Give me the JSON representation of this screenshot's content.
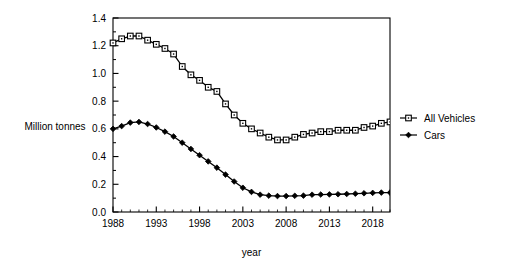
{
  "chart_data": {
    "type": "line",
    "title": "",
    "xlabel": "year",
    "ylabel": "Million tonnes",
    "xlim": [
      1988,
      2020
    ],
    "ylim": [
      0.0,
      1.4
    ],
    "grid": false,
    "legend_position": "right",
    "x_ticks": [
      "1988",
      "1993",
      "1998",
      "2003",
      "2008",
      "2013",
      "2018"
    ],
    "x_tick_values": [
      1988,
      1993,
      1998,
      2003,
      2008,
      2013,
      2018
    ],
    "x_minor_tick_interval": 1,
    "y_ticks": [
      "0.0",
      "0.2",
      "0.4",
      "0.6",
      "0.8",
      "1.0",
      "1.2",
      "1.4"
    ],
    "y_tick_values": [
      0.0,
      0.2,
      0.4,
      0.6,
      0.8,
      1.0,
      1.2,
      1.4
    ],
    "y_minor_tick_interval": 0.1,
    "x": [
      1988,
      1989,
      1990,
      1991,
      1992,
      1993,
      1994,
      1995,
      1996,
      1997,
      1998,
      1999,
      2000,
      2001,
      2002,
      2003,
      2004,
      2005,
      2006,
      2007,
      2008,
      2009,
      2010,
      2011,
      2012,
      2013,
      2014,
      2015,
      2016,
      2017,
      2018,
      2019,
      2020
    ],
    "series": [
      {
        "name": "All Vehicles",
        "marker": "open-square",
        "color": "#000000",
        "values": [
          1.22,
          1.25,
          1.27,
          1.27,
          1.24,
          1.21,
          1.18,
          1.14,
          1.05,
          0.99,
          0.95,
          0.9,
          0.87,
          0.78,
          0.7,
          0.64,
          0.6,
          0.57,
          0.54,
          0.52,
          0.52,
          0.54,
          0.56,
          0.57,
          0.58,
          0.58,
          0.59,
          0.59,
          0.59,
          0.61,
          0.62,
          0.64,
          0.65
        ]
      },
      {
        "name": "Cars",
        "marker": "filled-diamond",
        "color": "#000000",
        "values": [
          0.6,
          0.62,
          0.645,
          0.65,
          0.635,
          0.61,
          0.58,
          0.545,
          0.5,
          0.455,
          0.41,
          0.365,
          0.32,
          0.27,
          0.22,
          0.175,
          0.145,
          0.125,
          0.118,
          0.115,
          0.115,
          0.117,
          0.118,
          0.125,
          0.126,
          0.127,
          0.128,
          0.13,
          0.132,
          0.135,
          0.138,
          0.14,
          0.14
        ]
      }
    ]
  },
  "legend": {
    "items": [
      {
        "label": "All Vehicles"
      },
      {
        "label": "Cars"
      }
    ]
  }
}
